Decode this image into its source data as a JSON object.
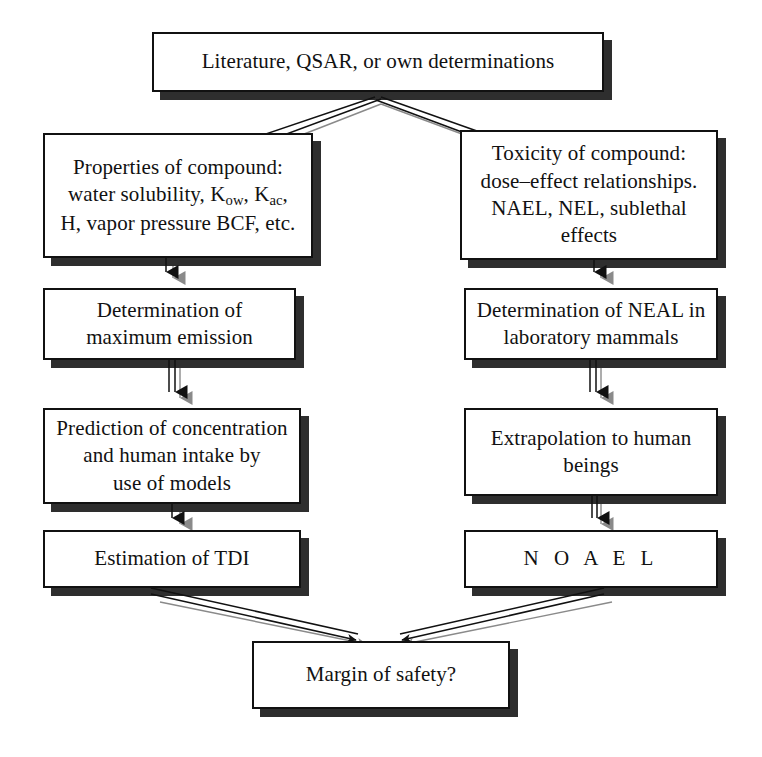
{
  "diagram": {
    "title_text": "Risk assessment flow chart",
    "background_color": "#ffffff",
    "box_border_color": "#111111",
    "shadow_color": "#2e2e2e",
    "nodes": {
      "source": {
        "text": "Literature, QSAR, or own determinations",
        "x": 152,
        "y": 32,
        "w": 452,
        "h": 60
      },
      "properties": {
        "line1": "Properties of compound:",
        "line2_pre": "water solubility, K",
        "line2_sub1": "ow",
        "line2_mid": ", K",
        "line2_sub2": "ac",
        "line2_post": ",",
        "line3": "H, vapor pressure BCF, etc.",
        "x": 43,
        "y": 133,
        "w": 270,
        "h": 125
      },
      "toxicity": {
        "text": "Toxicity of compound:\ndose–effect relationships.\nNAEL, NEL, sublethal\neffects",
        "x": 460,
        "y": 130,
        "w": 258,
        "h": 130
      },
      "max_emission": {
        "text": "Determination of\nmaximum emission",
        "x": 43,
        "y": 288,
        "w": 253,
        "h": 72
      },
      "neal_lab": {
        "text": "Determination of NEAL in\nlaboratory mammals",
        "x": 464,
        "y": 288,
        "w": 254,
        "h": 72
      },
      "prediction": {
        "text": "Prediction of concentration\nand human intake by\nuse of models",
        "x": 43,
        "y": 408,
        "w": 258,
        "h": 96
      },
      "extrapolation": {
        "text": "Extrapolation to human\nbeings",
        "x": 464,
        "y": 408,
        "w": 254,
        "h": 88
      },
      "tdi": {
        "text": "Estimation of TDI",
        "x": 43,
        "y": 530,
        "w": 258,
        "h": 58
      },
      "noael": {
        "text": "N O A E L",
        "x": 464,
        "y": 530,
        "w": 254,
        "h": 58
      },
      "margin": {
        "text": "Margin of safety?",
        "x": 252,
        "y": 641,
        "w": 258,
        "h": 68
      }
    }
  }
}
